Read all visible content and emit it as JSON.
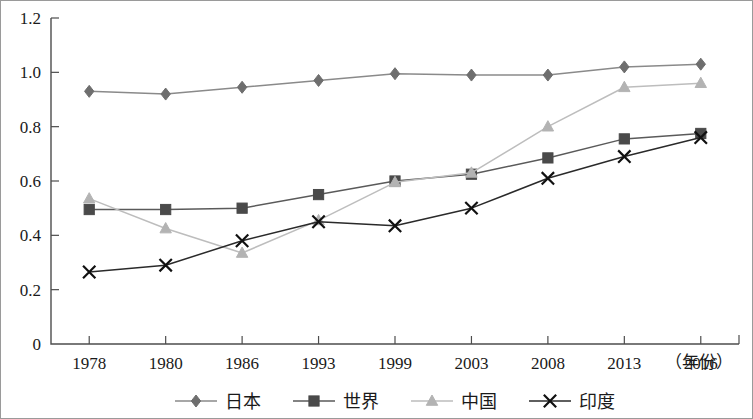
{
  "chart_data": {
    "type": "line",
    "title": "",
    "subtitle": "",
    "xlabel": "（年份）",
    "ylabel": "",
    "categories": [
      "1978",
      "1980",
      "1986",
      "1993",
      "1999",
      "2003",
      "2008",
      "2013",
      "2016"
    ],
    "x": [
      1978,
      1980,
      1986,
      1993,
      1999,
      2003,
      2008,
      2013,
      2016
    ],
    "ylim": [
      0,
      1.2
    ],
    "ytick_labels": [
      "0",
      "0.2",
      "0.4",
      "0.6",
      "0.8",
      "1.0",
      "1.2"
    ],
    "yticks": [
      0,
      0.2,
      0.4,
      0.6,
      0.8,
      1.0,
      1.2
    ],
    "grid": false,
    "legend_position": "bottom",
    "series": [
      {
        "name": "日本",
        "marker": "diamond",
        "color": "#6e6e6e",
        "line_color": "#8a8a8a",
        "values": [
          0.93,
          0.92,
          0.945,
          0.97,
          0.995,
          0.99,
          0.99,
          1.02,
          1.03
        ]
      },
      {
        "name": "世界",
        "marker": "square",
        "color": "#4a4a4a",
        "line_color": "#5a5a5a",
        "values": [
          0.495,
          0.495,
          0.5,
          0.55,
          0.6,
          0.625,
          0.685,
          0.755,
          0.775
        ]
      },
      {
        "name": "中国",
        "marker": "triangle",
        "color": "#b3b3b3",
        "line_color": "#bdbdbd",
        "values": [
          0.535,
          0.425,
          0.335,
          0.455,
          0.595,
          0.63,
          0.8,
          0.945,
          0.96
        ]
      },
      {
        "name": "印度",
        "marker": "cross",
        "color": "#111111",
        "line_color": "#2a2a2a",
        "values": [
          0.265,
          0.29,
          0.38,
          0.45,
          0.435,
          0.5,
          0.61,
          0.69,
          0.76
        ]
      }
    ]
  }
}
